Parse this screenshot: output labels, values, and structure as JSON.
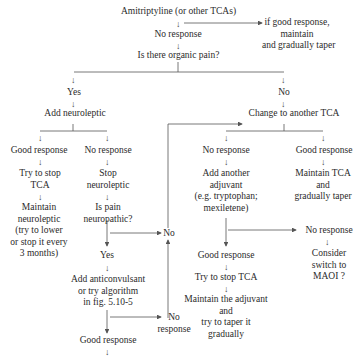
{
  "nodes": {
    "start": "Amitriptyline (or other TCAs)",
    "good_top": [
      "if good response,",
      "maintain",
      "and gradually taper"
    ],
    "no_response_1": "No response",
    "organic": "Is there organic pain?",
    "yes": "Yes",
    "no": "No",
    "add_neuroleptic": "Add neuroleptic",
    "change_tca": "Change to another TCA",
    "l_good": "Good response",
    "l_no": "No response",
    "try_stop_tca": [
      "Try to stop",
      "TCA"
    ],
    "maintain_neuro": [
      "Maintain",
      "neuroleptic",
      "(try to lower",
      "or stop it every",
      "3 months)"
    ],
    "stop_neuro": [
      "Stop",
      "neuroleptic"
    ],
    "is_neuropathic": [
      "Is pain",
      "neuropathic?"
    ],
    "mid_no": "No",
    "neuro_yes": "Yes",
    "anticonvulsant": [
      "Add anticonvulsant",
      "or try algorithm",
      "in fig. 5.10-5"
    ],
    "no_response_mid": [
      "No",
      "response"
    ],
    "good_bottom": "Good response",
    "r_no": "No response",
    "r_good": "Good response",
    "another_adjuvant": [
      "Add another",
      "adjuvant",
      "(e.g. tryptophan;",
      "mexiletene)"
    ],
    "maintain_tca": [
      "Maintain TCA",
      "and",
      "gradually taper"
    ],
    "r_no2": "No response",
    "maoi": [
      "Consider",
      "switch to",
      "MAOI ?"
    ],
    "r_good2": "Good response",
    "try_stop_tca2": "Try to stop TCA",
    "maintain_adjuvant": [
      "Maintain the adjuvant",
      "and",
      "try to taper it",
      "gradually"
    ]
  },
  "glyphs": {
    "down_arrow": "↓",
    "up_arrow": "↑"
  },
  "colors": {
    "line": "#555555",
    "text": "#2a2a2a"
  }
}
